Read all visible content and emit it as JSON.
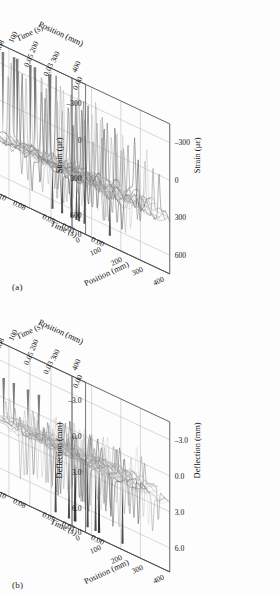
{
  "figure": {
    "background": "#fdfdfd",
    "ink": "#1a1a1a",
    "grid_color": "#b9b9b9",
    "panels": [
      {
        "id": "a",
        "caption": "(a)",
        "zlabel_left": "Strain (με)",
        "zlabel_right": "Strain (με)",
        "xlabel_bottom": "Position (mm)",
        "xlabel_top": "Position (mm)",
        "ylabel_bottom": "Time (s)",
        "ylabel_top": "Time (s)",
        "z_ticks": [
          "600",
          "300",
          "0",
          "–300"
        ],
        "z_origin_tick": "0",
        "x_ticks_bottom": [
          "0",
          "100",
          "200",
          "300",
          "400"
        ],
        "x_ticks_top": [
          "100",
          "200",
          "300",
          "400"
        ],
        "y_ticks_bottom": [
          "0.00",
          "0.03",
          "0.05",
          "0.08",
          "0.10"
        ],
        "y_ticks_top": [
          "0.00",
          "0.03",
          "0.05",
          "0.08",
          "0.10"
        ]
      },
      {
        "id": "b",
        "caption": "(b)",
        "zlabel_left": "Deflection (mm)",
        "zlabel_right": "Deflection (mm)",
        "xlabel_bottom": "Position (mm)",
        "xlabel_top": "Position (mm)",
        "ylabel_bottom": "Time (s)",
        "ylabel_top": "Time (s)",
        "z_ticks": [
          "6.0",
          "3.0",
          "0.0",
          "–3.0"
        ],
        "z_origin_tick": "0",
        "x_ticks_bottom": [
          "0",
          "100",
          "200",
          "300",
          "400"
        ],
        "x_ticks_top": [
          "100",
          "200",
          "300",
          "400"
        ],
        "y_ticks_bottom": [
          "0.00",
          "0.03",
          "0.05",
          "0.08",
          "0.10"
        ],
        "y_ticks_top": [
          "0.00",
          "0.03",
          "0.05",
          "0.08",
          "0.10"
        ]
      }
    ]
  },
  "chart_data": [
    {
      "type": "line",
      "title": "(a) Strain waterfall",
      "projection": "3d",
      "grid": true,
      "legend": null,
      "xlabel": "Position (mm)",
      "ylabel": "Time (s)",
      "zlabel": "Strain (με)",
      "xlim": [
        0,
        400
      ],
      "ylim": [
        0.0,
        0.1
      ],
      "zlim": [
        -450,
        750
      ],
      "xticks": [
        0,
        100,
        200,
        300,
        400
      ],
      "yticks": [
        0.0,
        0.03,
        0.05,
        0.08,
        0.1
      ],
      "zticks": [
        -300,
        0,
        300,
        600
      ],
      "series_count": 18,
      "description": "Dense overlaid time histories of strain along the beam; baseline oscillation band roughly -300 to +300 microstrain with tall narrow positive spikes reaching ~650-700 microstrain at the far-time edge, and dark negative excursions near -350 along the near-position edge.",
      "series": [
        {
          "name": "pos 0 mm",
          "baseline": 0,
          "spike_peak": 640,
          "spike_min": -330,
          "tone": "#8f8f8f"
        },
        {
          "name": "pos 25 mm",
          "baseline": 10,
          "spike_peak": 660,
          "spike_min": -340,
          "tone": "#9a9a9a"
        },
        {
          "name": "pos 50 mm",
          "baseline": 5,
          "spike_peak": 690,
          "spike_min": -350,
          "tone": "#707070"
        },
        {
          "name": "pos 75 mm",
          "baseline": -5,
          "spike_peak": 700,
          "spike_min": -320,
          "tone": "#555555"
        },
        {
          "name": "pos 100 mm",
          "baseline": 0,
          "spike_peak": 670,
          "spike_min": -300,
          "tone": "#b0b0b0"
        },
        {
          "name": "pos 125 mm",
          "baseline": 15,
          "spike_peak": 620,
          "spike_min": -290,
          "tone": "#c4c4c4"
        },
        {
          "name": "pos 150 mm",
          "baseline": 20,
          "spike_peak": 600,
          "spike_min": -310,
          "tone": "#999999"
        },
        {
          "name": "pos 175 mm",
          "baseline": 10,
          "spike_peak": 580,
          "spike_min": -330,
          "tone": "#787878"
        },
        {
          "name": "pos 200 mm",
          "baseline": 0,
          "spike_peak": 560,
          "spike_min": -360,
          "tone": "#606060"
        },
        {
          "name": "pos 225 mm",
          "baseline": -10,
          "spike_peak": 540,
          "spike_min": -340,
          "tone": "#a8a8a8"
        },
        {
          "name": "pos 250 mm",
          "baseline": 5,
          "spike_peak": 520,
          "spike_min": -300,
          "tone": "#c9c9c9"
        },
        {
          "name": "pos 275 mm",
          "baseline": 12,
          "spike_peak": 500,
          "spike_min": -280,
          "tone": "#8a8a8a"
        },
        {
          "name": "pos 300 mm",
          "baseline": 8,
          "spike_peak": 470,
          "spike_min": -300,
          "tone": "#6d6d6d"
        },
        {
          "name": "pos 325 mm",
          "baseline": 0,
          "spike_peak": 450,
          "spike_min": -320,
          "tone": "#4f4f4f"
        },
        {
          "name": "pos 350 mm",
          "baseline": -5,
          "spike_peak": 420,
          "spike_min": -330,
          "tone": "#b6b6b6"
        },
        {
          "name": "pos 375 mm",
          "baseline": 5,
          "spike_peak": 400,
          "spike_min": -300,
          "tone": "#cccccc"
        },
        {
          "name": "pos 400 mm",
          "baseline": 0,
          "spike_peak": 380,
          "spike_min": -290,
          "tone": "#909090"
        },
        {
          "name": "pos 410 mm",
          "baseline": 0,
          "spike_peak": 360,
          "spike_min": -270,
          "tone": "#7c7c7c"
        }
      ]
    },
    {
      "type": "line",
      "title": "(b) Deflection waterfall",
      "projection": "3d",
      "grid": true,
      "legend": null,
      "xlabel": "Position (mm)",
      "ylabel": "Time (s)",
      "zlabel": "Deflection (mm)",
      "xlim": [
        0,
        400
      ],
      "ylim": [
        0.0,
        0.1
      ],
      "zlim": [
        -5.0,
        7.5
      ],
      "xticks": [
        0,
        100,
        200,
        300,
        400
      ],
      "yticks": [
        0.0,
        0.03,
        0.05,
        0.08,
        0.1
      ],
      "zticks": [
        -3.0,
        0.0,
        3.0,
        6.0
      ],
      "series_count": 18,
      "description": "Deflection histories form a near-flat sheet clustered between 0.0 and 3.0 mm with light grey ribbons; sharp dark negative spikes plunge to about -4.5 mm along the near edge and a few light positive spikes rise toward 4.5 mm at the right.",
      "series": [
        {
          "name": "pos 0 mm",
          "baseline": 1.2,
          "spike_peak": 3.2,
          "spike_min": -4.4,
          "tone": "#a5a5a5"
        },
        {
          "name": "pos 25 mm",
          "baseline": 1.3,
          "spike_peak": 3.0,
          "spike_min": -4.5,
          "tone": "#b2b2b2"
        },
        {
          "name": "pos 50 mm",
          "baseline": 1.1,
          "spike_peak": 2.8,
          "spike_min": -4.2,
          "tone": "#8c8c8c"
        },
        {
          "name": "pos 75 mm",
          "baseline": 1.0,
          "spike_peak": 2.6,
          "spike_min": -3.8,
          "tone": "#6f6f6f"
        },
        {
          "name": "pos 100 mm",
          "baseline": 1.2,
          "spike_peak": 2.9,
          "spike_min": -4.0,
          "tone": "#c0c0c0"
        },
        {
          "name": "pos 125 mm",
          "baseline": 1.4,
          "spike_peak": 3.1,
          "spike_min": -3.6,
          "tone": "#cfcfcf"
        },
        {
          "name": "pos 150 mm",
          "baseline": 1.3,
          "spike_peak": 3.0,
          "spike_min": -3.4,
          "tone": "#a0a0a0"
        },
        {
          "name": "pos 175 mm",
          "baseline": 1.1,
          "spike_peak": 2.7,
          "spike_min": -3.9,
          "tone": "#838383"
        },
        {
          "name": "pos 200 mm",
          "baseline": 1.0,
          "spike_peak": 2.5,
          "spike_min": -4.3,
          "tone": "#585858"
        },
        {
          "name": "pos 225 mm",
          "baseline": 1.2,
          "spike_peak": 2.8,
          "spike_min": -4.1,
          "tone": "#aeaeae"
        },
        {
          "name": "pos 250 mm",
          "baseline": 1.3,
          "spike_peak": 3.2,
          "spike_min": -3.7,
          "tone": "#d2d2d2"
        },
        {
          "name": "pos 275 mm",
          "baseline": 1.4,
          "spike_peak": 3.4,
          "spike_min": -3.3,
          "tone": "#949494"
        },
        {
          "name": "pos 300 mm",
          "baseline": 1.2,
          "spike_peak": 3.6,
          "spike_min": -3.5,
          "tone": "#6a6a6a"
        },
        {
          "name": "pos 325 mm",
          "baseline": 1.1,
          "spike_peak": 3.8,
          "spike_min": -3.9,
          "tone": "#4a4a4a"
        },
        {
          "name": "pos 350 mm",
          "baseline": 1.3,
          "spike_peak": 4.2,
          "spike_min": -3.2,
          "tone": "#bdbdbd"
        },
        {
          "name": "pos 375 mm",
          "baseline": 1.2,
          "spike_peak": 4.5,
          "spike_min": -2.9,
          "tone": "#d6d6d6"
        },
        {
          "name": "pos 400 mm",
          "baseline": 1.0,
          "spike_peak": 4.0,
          "spike_min": -3.0,
          "tone": "#9b9b9b"
        },
        {
          "name": "pos 410 mm",
          "baseline": 1.1,
          "spike_peak": 3.5,
          "spike_min": -2.8,
          "tone": "#7e7e7e"
        }
      ]
    }
  ]
}
